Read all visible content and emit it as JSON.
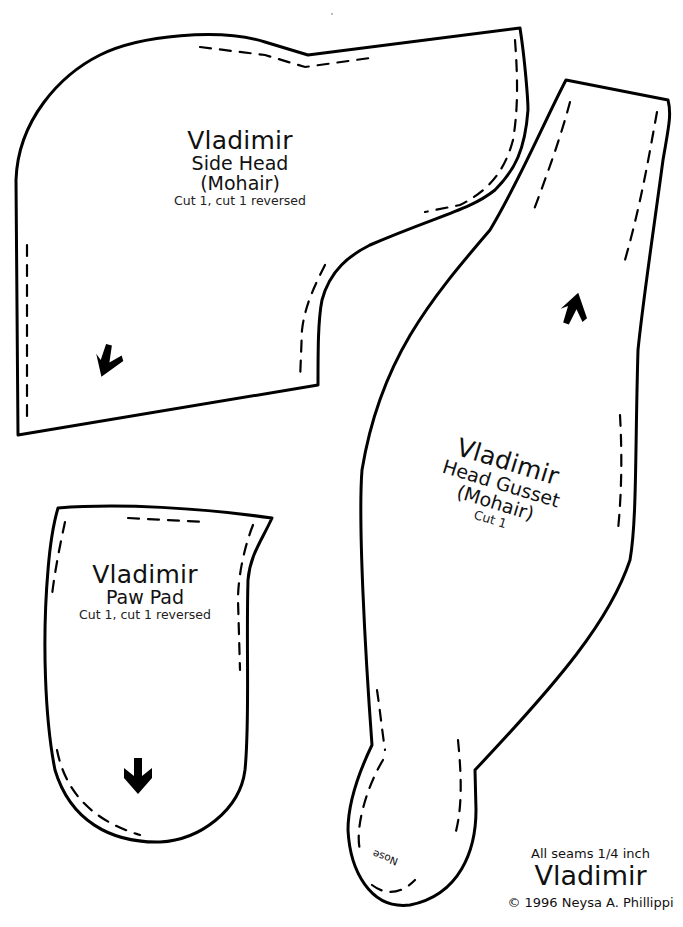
{
  "pieces": {
    "side_head": {
      "name": "Vladimir",
      "part": "Side Head",
      "material": "(Mohair)",
      "cut": "Cut 1, cut 1 reversed",
      "grain_arrow": "arrow-down-icon"
    },
    "head_gusset": {
      "name": "Vladimir",
      "part": "Head Gusset",
      "material": "(Mohair)",
      "cut": "Cut 1",
      "grain_arrow": "arrow-up-icon",
      "nose_label": "Nose"
    },
    "paw_pad": {
      "name": "Vladimir",
      "part": "Paw Pad",
      "cut": "Cut 1, cut 1 reversed",
      "grain_arrow": "arrow-down-icon"
    }
  },
  "footer": {
    "seam_allowance": "All seams 1/4 inch",
    "title": "Vladimir",
    "copyright": "© 1996 Neysa A. Phillippi"
  },
  "colors": {
    "outline": "#000000",
    "background": "#ffffff"
  }
}
